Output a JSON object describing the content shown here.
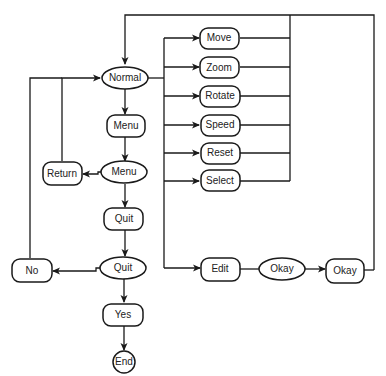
{
  "diagram": {
    "type": "flowchart",
    "nodes": {
      "normal": {
        "label": "Normal",
        "shape": "ellipse"
      },
      "menu_box": {
        "label": "Menu",
        "shape": "rounded-rect"
      },
      "menu_ellipse": {
        "label": "Menu",
        "shape": "ellipse"
      },
      "return": {
        "label": "Return",
        "shape": "rounded-rect"
      },
      "quit_box": {
        "label": "Quit",
        "shape": "rounded-rect"
      },
      "quit_ellipse": {
        "label": "Quit",
        "shape": "ellipse"
      },
      "no": {
        "label": "No",
        "shape": "rounded-rect"
      },
      "yes": {
        "label": "Yes",
        "shape": "rounded-rect"
      },
      "end": {
        "label": "End",
        "shape": "circle"
      },
      "move": {
        "label": "Move",
        "shape": "rounded-rect"
      },
      "zoom": {
        "label": "Zoom",
        "shape": "rounded-rect"
      },
      "rotate": {
        "label": "Rotate",
        "shape": "rounded-rect"
      },
      "speed": {
        "label": "Speed",
        "shape": "rounded-rect"
      },
      "reset": {
        "label": "Reset",
        "shape": "rounded-rect"
      },
      "select": {
        "label": "Select",
        "shape": "rounded-rect"
      },
      "edit": {
        "label": "Edit",
        "shape": "rounded-rect"
      },
      "okay_ellipse": {
        "label": "Okay",
        "shape": "ellipse"
      },
      "okay_box": {
        "label": "Okay",
        "shape": "rounded-rect"
      }
    },
    "edges": [
      [
        "normal",
        "menu_box"
      ],
      [
        "menu_box",
        "menu_ellipse"
      ],
      [
        "menu_ellipse",
        "return"
      ],
      [
        "return",
        "normal"
      ],
      [
        "menu_ellipse",
        "quit_box"
      ],
      [
        "quit_box",
        "quit_ellipse"
      ],
      [
        "quit_ellipse",
        "no"
      ],
      [
        "no",
        "normal"
      ],
      [
        "quit_ellipse",
        "yes"
      ],
      [
        "yes",
        "end"
      ],
      [
        "normal",
        "move"
      ],
      [
        "normal",
        "zoom"
      ],
      [
        "normal",
        "rotate"
      ],
      [
        "normal",
        "speed"
      ],
      [
        "normal",
        "reset"
      ],
      [
        "normal",
        "select"
      ],
      [
        "normal",
        "edit"
      ],
      [
        "edit",
        "okay_ellipse"
      ],
      [
        "okay_ellipse",
        "okay_box"
      ],
      [
        "move",
        "normal"
      ],
      [
        "zoom",
        "normal"
      ],
      [
        "rotate",
        "normal"
      ],
      [
        "speed",
        "normal"
      ],
      [
        "reset",
        "normal"
      ],
      [
        "select",
        "normal"
      ],
      [
        "okay_box",
        "normal"
      ]
    ]
  }
}
